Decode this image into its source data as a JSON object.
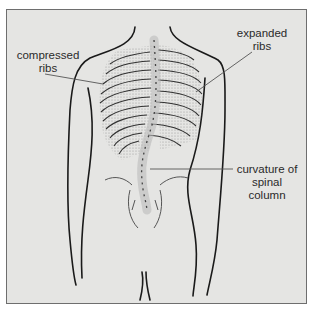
{
  "figure": {
    "colors": {
      "background": "#e5e5e3",
      "border": "#6e6e6e",
      "outline": "#1a1a1a",
      "stipple": "#8a8a8a",
      "leader_line": "#555555",
      "label_text": "#2a2a2a"
    },
    "labels": [
      {
        "id": "compressed-ribs",
        "line1": "compressed",
        "line2": "ribs"
      },
      {
        "id": "expanded-ribs",
        "line1": "expanded",
        "line2": "ribs"
      },
      {
        "id": "curvature",
        "line1": "curvature of",
        "line2": "spinal column"
      }
    ]
  }
}
